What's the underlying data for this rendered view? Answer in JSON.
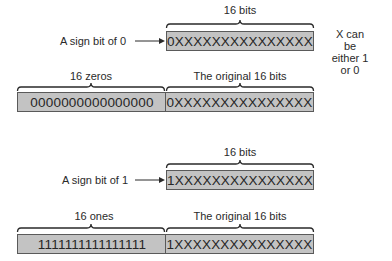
{
  "top_section": {
    "brace_label": "16 bits",
    "sign_label": "A sign bit of 0",
    "box_value": "0XXXXXXXXXXXXXXX",
    "note_line1": "X can be",
    "note_line2": "either 1 or 0",
    "extended": {
      "left_label": "16 zeros",
      "right_label": "The original 16 bits",
      "left_value": "0000000000000000",
      "right_value": "0XXXXXXXXXXXXXXX"
    }
  },
  "bottom_section": {
    "brace_label": "16 bits",
    "sign_label": "A sign bit of 1",
    "box_value": "1XXXXXXXXXXXXXXX",
    "extended": {
      "left_label": "16 ones",
      "right_label": "The original 16 bits",
      "left_value": "1111111111111111",
      "right_value": "1XXXXXXXXXXXXXXX"
    }
  },
  "colors": {
    "box_fill": "#c3c3c3",
    "box_border": "#5a5a5a",
    "text": "#2a2a2a"
  }
}
